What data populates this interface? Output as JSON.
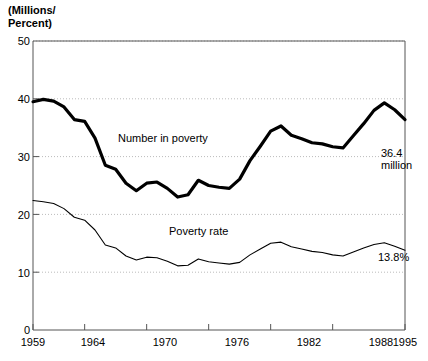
{
  "chart_data": {
    "type": "line",
    "title": "(Millions/\nPercent)",
    "xlabel": "",
    "ylabel": "(Millions/Percent)",
    "xlim": [
      1959,
      1995
    ],
    "ylim": [
      0,
      50
    ],
    "grid": true,
    "legend_position": "inline-annotations",
    "yticks": [
      0,
      10,
      20,
      30,
      40,
      50
    ],
    "ytick_labels": [
      "0",
      "10",
      "20",
      "30",
      "40",
      "50"
    ],
    "xticks": [
      1959,
      1964,
      1970,
      1976,
      1982,
      1988,
      1995
    ],
    "xtick_labels": [
      "1959",
      "1964",
      "1970",
      "1976",
      "1982",
      "1988",
      "1995"
    ],
    "x": [
      1959,
      1960,
      1961,
      1962,
      1963,
      1964,
      1965,
      1966,
      1967,
      1968,
      1969,
      1970,
      1971,
      1972,
      1973,
      1974,
      1975,
      1976,
      1977,
      1978,
      1979,
      1980,
      1981,
      1982,
      1983,
      1984,
      1985,
      1986,
      1987,
      1988,
      1989,
      1990,
      1991,
      1992,
      1993,
      1994,
      1995
    ],
    "series": [
      {
        "name": "Number in poverty",
        "units": "millions",
        "style": "thick-black",
        "values": [
          39.5,
          39.9,
          39.6,
          38.6,
          36.4,
          36.1,
          33.2,
          28.5,
          27.8,
          25.4,
          24.1,
          25.4,
          25.6,
          24.5,
          23.0,
          23.4,
          25.9,
          25.0,
          24.7,
          24.5,
          26.1,
          29.3,
          31.8,
          34.4,
          35.3,
          33.7,
          33.1,
          32.4,
          32.2,
          31.7,
          31.5,
          33.6,
          35.7,
          38.0,
          39.3,
          38.1,
          36.4
        ],
        "end_label": "36.4\nmillion"
      },
      {
        "name": "Poverty rate",
        "units": "percent",
        "style": "thin-black",
        "values": [
          22.4,
          22.2,
          21.9,
          21.0,
          19.5,
          19.0,
          17.3,
          14.7,
          14.2,
          12.8,
          12.1,
          12.6,
          12.5,
          11.9,
          11.1,
          11.2,
          12.3,
          11.8,
          11.6,
          11.4,
          11.7,
          13.0,
          14.0,
          15.0,
          15.2,
          14.4,
          14.0,
          13.6,
          13.4,
          13.0,
          12.8,
          13.5,
          14.2,
          14.8,
          15.1,
          14.5,
          13.8
        ],
        "end_label": "13.8%"
      }
    ],
    "annotations": [
      {
        "name": "number-in-poverty-label",
        "text": "Number in poverty",
        "x": 1968.5,
        "y": 32.5
      },
      {
        "name": "poverty-rate-label",
        "text": "Poverty rate",
        "x": 1971.5,
        "y": 17.2
      },
      {
        "name": "number-end-label",
        "text": "36.4\nmillion",
        "x": 1993.0,
        "y": 31.5
      },
      {
        "name": "rate-end-label",
        "text": "13.8%",
        "x": 1992.5,
        "y": 10.5
      }
    ]
  }
}
